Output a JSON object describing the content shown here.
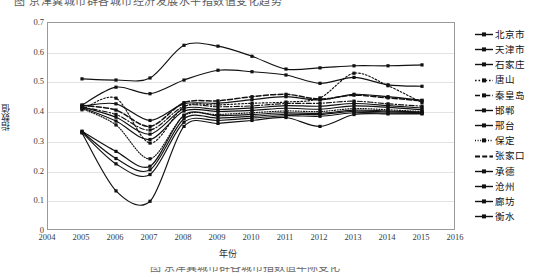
{
  "caption_top": "图 京津冀城市群各城市经济发展水平指数值变化趋势",
  "caption_bottom": "图 京津冀城市群各城市指数值年际变化",
  "axis": {
    "ylabel": "指数值",
    "xlabel": "年份",
    "yticks": [
      "0.7",
      "0.6",
      "0.5",
      "0.4",
      "0.3",
      "0.2",
      "0.1",
      "0"
    ],
    "xticks": [
      "2004",
      "2005",
      "2006",
      "2007",
      "2008",
      "2009",
      "2010",
      "2011",
      "2012",
      "2013",
      "2014",
      "2015",
      "2016"
    ]
  },
  "chart_data": {
    "type": "line",
    "title": "",
    "xlabel": "年份",
    "ylabel": "指数值",
    "xlim": [
      2004,
      2016
    ],
    "ylim": [
      0,
      0.7
    ],
    "grid": true,
    "legend_position": "right",
    "x": [
      2005,
      2006,
      2007,
      2008,
      2009,
      2010,
      2011,
      2012,
      2013,
      2014,
      2015
    ],
    "series": [
      {
        "name": "北京市",
        "style": "solid",
        "values": [
          0.512,
          0.508,
          0.515,
          0.625,
          0.622,
          0.588,
          0.545,
          0.549,
          0.556,
          0.556,
          0.559
        ]
      },
      {
        "name": "天津市",
        "style": "solid",
        "values": [
          0.424,
          0.484,
          0.462,
          0.508,
          0.541,
          0.536,
          0.525,
          0.497,
          0.517,
          0.492,
          0.487
        ]
      },
      {
        "name": "石家庄",
        "style": "solid",
        "values": [
          0.42,
          0.428,
          0.372,
          0.428,
          0.43,
          0.442,
          0.452,
          0.441,
          0.46,
          0.452,
          0.44
        ]
      },
      {
        "name": "唐山",
        "style": "dotted",
        "values": [
          0.408,
          0.447,
          0.296,
          0.418,
          0.424,
          0.43,
          0.434,
          0.448,
          0.531,
          0.489,
          0.432
        ]
      },
      {
        "name": "秦皇岛",
        "style": "dashdot",
        "values": [
          0.417,
          0.392,
          0.34,
          0.42,
          0.418,
          0.421,
          0.429,
          0.43,
          0.437,
          0.428,
          0.42
        ]
      },
      {
        "name": "邯郸",
        "style": "solid",
        "values": [
          0.418,
          0.383,
          0.326,
          0.412,
          0.409,
          0.414,
          0.422,
          0.42,
          0.429,
          0.422,
          0.414
        ]
      },
      {
        "name": "邢台",
        "style": "solid",
        "values": [
          0.415,
          0.37,
          0.308,
          0.404,
          0.402,
          0.406,
          0.413,
          0.41,
          0.421,
          0.416,
          0.408
        ]
      },
      {
        "name": "保定",
        "style": "fine-dot",
        "values": [
          0.412,
          0.357,
          0.243,
          0.388,
          0.392,
          0.398,
          0.404,
          0.402,
          0.412,
          0.408,
          0.402
        ]
      },
      {
        "name": "张家口",
        "style": "dashed",
        "values": [
          0.423,
          0.407,
          0.352,
          0.432,
          0.438,
          0.452,
          0.46,
          0.444,
          0.457,
          0.448,
          0.438
        ]
      },
      {
        "name": "承德",
        "style": "solid",
        "values": [
          0.336,
          0.268,
          0.218,
          0.39,
          0.388,
          0.392,
          0.398,
          0.396,
          0.407,
          0.404,
          0.4
        ]
      },
      {
        "name": "沧州",
        "style": "solid",
        "values": [
          0.334,
          0.244,
          0.206,
          0.378,
          0.38,
          0.386,
          0.393,
          0.392,
          0.403,
          0.401,
          0.398
        ]
      },
      {
        "name": "廊坊",
        "style": "solid",
        "values": [
          0.332,
          0.226,
          0.19,
          0.366,
          0.372,
          0.38,
          0.388,
          0.386,
          0.398,
          0.397,
          0.396
        ]
      },
      {
        "name": "衡水",
        "style": "solid",
        "values": [
          0.33,
          0.135,
          0.1,
          0.352,
          0.362,
          0.372,
          0.382,
          0.352,
          0.392,
          0.394,
          0.394
        ]
      }
    ]
  }
}
